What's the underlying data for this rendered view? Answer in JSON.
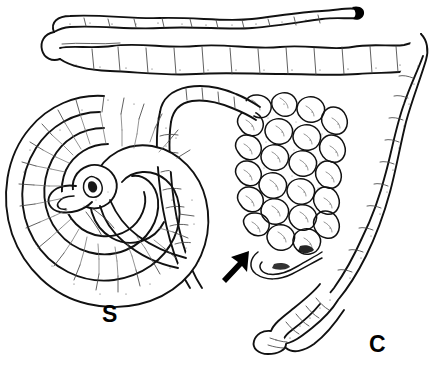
{
  "figure": {
    "type": "anatomical-line-drawing",
    "background_color": "#ffffff",
    "ink_color": "#111111",
    "width": 431,
    "height": 367
  },
  "labels": [
    {
      "id": "label-s",
      "text": "S",
      "meaning": "spiral colon",
      "x": 102,
      "y": 303,
      "font_size": 23,
      "bold": true,
      "color": "#000000"
    },
    {
      "id": "label-c",
      "text": "C",
      "meaning": "caecum",
      "x": 369,
      "y": 333,
      "font_size": 23,
      "bold": true,
      "color": "#000000"
    }
  ],
  "annotations": [
    {
      "id": "pointer-arrow",
      "icon": "arrow-icon",
      "direction": "up-right",
      "tail_x": 222,
      "tail_y": 282,
      "tip_x": 249,
      "tip_y": 251,
      "color": "#000000"
    }
  ],
  "structures": [
    {
      "id": "folded-tube",
      "name": "hairpin-folded-intestinal-tube",
      "position": "top",
      "description": "long sacculated tube doubled back on itself with a hairpin bend at the left and a dark blind tip at the upper right"
    },
    {
      "id": "spiral-colon",
      "name": "spiral-colon",
      "position": "left",
      "label": "S",
      "description": "flat spiral coil with a central rosette, radial haustral striations"
    },
    {
      "id": "coiled-small-intestine",
      "name": "coiled-small-intestine-mass",
      "position": "center",
      "marked_by": "pointer-arrow",
      "description": "densely convoluted mass of narrow intestinal loops"
    },
    {
      "id": "descending-limb",
      "name": "descending-limb",
      "position": "right",
      "description": "sacculated tube descending along the right margin from the upper right corner"
    },
    {
      "id": "caecum",
      "name": "caecum",
      "position": "bottom-right",
      "label": "C",
      "description": "blind-ended sacculated pouch with transverse striations"
    }
  ]
}
